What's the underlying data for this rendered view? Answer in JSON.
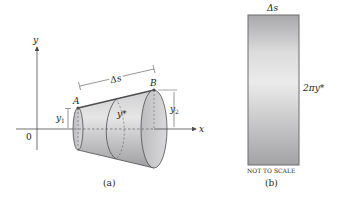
{
  "figure_a": {
    "axis_y_label": "y",
    "axis_x_label": "x",
    "origin_label": "0",
    "point_a_label": "A",
    "point_b_label": "B",
    "arc_length_label": "Δs",
    "y1_label": "y",
    "y1_sub": "1",
    "y2_label": "y",
    "y2_sub": "2",
    "ystar_label": "y*",
    "caption": "(a)"
  },
  "figure_b": {
    "top_label": "Δs",
    "side_label": "2πy*",
    "note": "NOT TO SCALE",
    "caption": "(b)"
  },
  "colors": {
    "stroke": "#4d4d4f",
    "surface_light": "#e2e2e3",
    "surface_dark": "#a9a9ab",
    "text": "#231f20"
  }
}
